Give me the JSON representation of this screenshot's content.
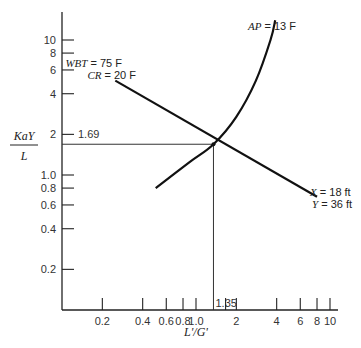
{
  "chart_data": {
    "type": "line",
    "title": "",
    "xlabel": "L'/G'",
    "ylabel_num": "KaY",
    "ylabel_den": "L",
    "xscale": "log",
    "yscale": "log",
    "xlim": [
      0.1,
      10
    ],
    "ylim": [
      0.1,
      10
    ],
    "grid": false,
    "x_ticks": [
      0.2,
      0.4,
      0.6,
      0.8,
      1.0,
      2,
      4,
      6,
      8,
      10
    ],
    "x_tick_labels": [
      "0.2",
      "0.4",
      "0.6",
      "0.8",
      "1.0",
      "2",
      "4",
      "6",
      "8",
      "10"
    ],
    "y_ticks": [
      0.2,
      0.4,
      0.6,
      0.8,
      1.0,
      2,
      4,
      6,
      8,
      10
    ],
    "y_tick_labels": [
      "0.2",
      "0.4",
      "0.6",
      "0.8",
      "1.0",
      "2",
      "4",
      "6",
      "8",
      "10"
    ],
    "series": [
      {
        "name": "tower characteristic",
        "kind": "straight",
        "points": [
          [
            0.25,
            5.0
          ],
          [
            1.35,
            1.69
          ],
          [
            8.0,
            0.69
          ]
        ],
        "label_lines": [
          {
            "var": "X",
            "text": " = 18 ft"
          },
          {
            "var": "Y",
            "text": " = 36 ft"
          }
        ]
      },
      {
        "name": "approach curve",
        "kind": "curve",
        "points": [
          [
            0.5,
            0.8
          ],
          [
            0.9,
            1.25
          ],
          [
            1.35,
            1.69
          ],
          [
            2.0,
            2.7
          ],
          [
            2.8,
            5.0
          ],
          [
            3.6,
            10.0
          ],
          [
            3.9,
            14.0
          ]
        ],
        "label_lines": [
          {
            "var": "AP",
            "text": " = 13 F"
          }
        ]
      }
    ],
    "conditions": [
      {
        "var": "WBT",
        "text": " = 75 F"
      },
      {
        "var": "CR",
        "text": " = 20 F"
      }
    ],
    "operating_point": {
      "x": 1.35,
      "y": 1.69,
      "x_label": "1.35",
      "y_label": "1.69"
    }
  }
}
